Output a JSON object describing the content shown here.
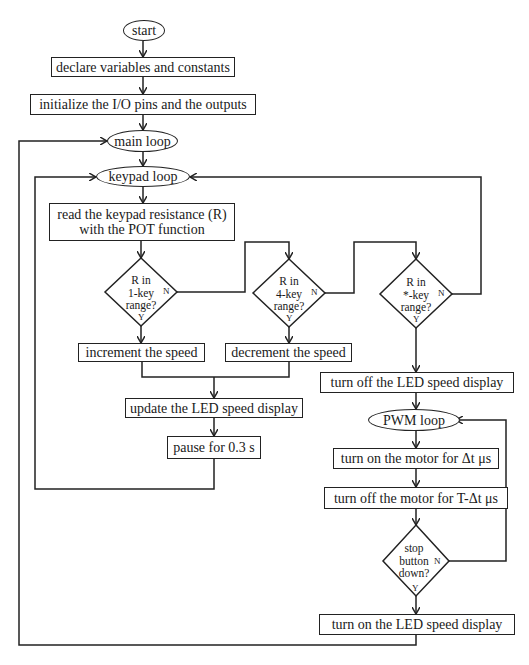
{
  "flowchart": {
    "start": "start",
    "declare": "declare variables and constants",
    "initialize": "initialize the I/O pins and the outputs",
    "main_loop": "main loop",
    "keypad_loop": "keypad loop",
    "read_line1": "read the keypad resistance (R)",
    "read_line2": "with the POT function",
    "decision1": {
      "line1": "R in",
      "line2": "1-key",
      "line3": "range?",
      "yes": "Y",
      "no": "N"
    },
    "decision2": {
      "line1": "R in",
      "line2": "4-key",
      "line3": "range?",
      "yes": "Y",
      "no": "N"
    },
    "decision3": {
      "line1": "R in",
      "line2": "*-key",
      "line3": "range?",
      "yes": "Y",
      "no": "N"
    },
    "increment": "increment the speed",
    "decrement": "decrement the speed",
    "update": "update the LED speed display",
    "pause": "pause for 0.3 s",
    "turn_off_led": "turn off the LED speed display",
    "pwm_loop": "PWM loop",
    "motor_on": "turn on the motor for Δt μs",
    "motor_off": "turn off the motor for T-Δt μs",
    "decision4": {
      "line1": "stop",
      "line2": "button",
      "line3": "down?",
      "yes": "Y",
      "no": "N"
    },
    "turn_on_led": "turn on the LED speed display"
  }
}
